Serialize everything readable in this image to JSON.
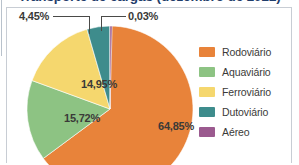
{
  "figure": {
    "title": "Transporte de cargas (dezembro de 2022)",
    "title_color": "#1f3d6b",
    "frame_color": "#c8cdd4",
    "background": "#ffffff"
  },
  "chart_data": {
    "type": "pie",
    "title": "Transporte de cargas (dezembro de 2022)",
    "xlabel": "",
    "ylabel": "",
    "legend_position": "right",
    "grid": false,
    "start_angle_clock": 12,
    "direction": "clockwise",
    "unit": "%",
    "decimal_separator": ",",
    "categories": [
      "Rodoviário",
      "Aquaviário",
      "Ferroviário",
      "Dutoviário",
      "Aéreo"
    ],
    "values": [
      64.85,
      15.72,
      14.95,
      4.45,
      0.03
    ],
    "labels": [
      "64,85%",
      "15,72%",
      "14,95%",
      "4,45%",
      "0,03%"
    ],
    "colors": [
      "#e8833a",
      "#8dc383",
      "#f5d76e",
      "#3e8c8c",
      "#9b5a8f"
    ],
    "slices": [
      {
        "name": "Rodoviário",
        "value": 64.85,
        "label": "64,85%",
        "color": "#e8833a",
        "label_placement": "inside"
      },
      {
        "name": "Aquaviário",
        "value": 15.72,
        "label": "15,72%",
        "color": "#8dc383",
        "label_placement": "inside"
      },
      {
        "name": "Ferroviário",
        "value": 14.95,
        "label": "14,95%",
        "color": "#f5d76e",
        "label_placement": "inside"
      },
      {
        "name": "Dutoviário",
        "value": 4.45,
        "label": "4,45%",
        "color": "#3e8c8c",
        "label_placement": "callout"
      },
      {
        "name": "Aéreo",
        "value": 0.03,
        "label": "0,03%",
        "color": "#9b5a8f",
        "label_placement": "callout"
      }
    ]
  },
  "pie_labels": {
    "rodoviario": "64,85%",
    "aquaviario": "15,72%",
    "ferroviario": "14,95%",
    "dutoviario": "4,45%",
    "aereo": "0,03%"
  },
  "legend": {
    "items": [
      {
        "label": "Rodoviário",
        "color": "#e8833a"
      },
      {
        "label": "Aquaviário",
        "color": "#8dc383"
      },
      {
        "label": "Ferroviário",
        "color": "#f5d76e"
      },
      {
        "label": "Dutoviário",
        "color": "#3e8c8c"
      },
      {
        "label": "Aéreo",
        "color": "#9b5a8f"
      }
    ]
  }
}
